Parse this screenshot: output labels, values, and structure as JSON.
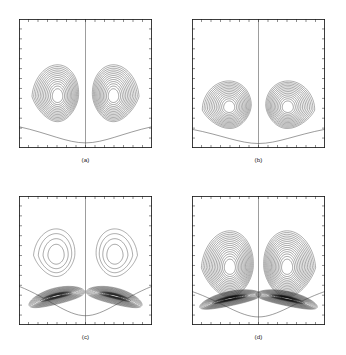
{
  "figure": {
    "type": "contour-plot-grid",
    "rows": 2,
    "cols": 2,
    "background_color": "#ffffff",
    "line_color": "#3a3a3a",
    "frame_color": "#1a1a1a"
  },
  "panels": [
    {
      "id": "a",
      "caption": "(a)",
      "position": {
        "x": 19,
        "y": 19,
        "width": 133,
        "height": 129
      },
      "description": "Symmetric counter-rotating vortex pair, centers at mid-height",
      "ticks": {
        "top": 14,
        "bottom": 14,
        "left": 13,
        "right": 13
      },
      "centerline": true,
      "vortex": {
        "cx_left": 0.29,
        "cx_right": 0.71,
        "cy": 0.6,
        "rings": 13,
        "rx": 0.175,
        "ry": 0.245,
        "tilt": 0,
        "dark_band": false
      },
      "separatrix": {
        "depth": 0.165,
        "present": true
      }
    },
    {
      "id": "b",
      "caption": "(b)",
      "position": {
        "x": 192,
        "y": 19,
        "width": 133,
        "height": 129
      },
      "description": "Vortex pair shifted downward, flattened cores, tighter spacing",
      "ticks": {
        "top": 14,
        "bottom": 14,
        "left": 13,
        "right": 13
      },
      "centerline": true,
      "vortex": {
        "cx_left": 0.28,
        "cx_right": 0.72,
        "cy": 0.685,
        "rings": 13,
        "rx": 0.185,
        "ry": 0.205,
        "tilt": 6,
        "dark_band": false
      },
      "separatrix": {
        "depth": 0.145,
        "present": true
      }
    },
    {
      "id": "c",
      "caption": "(c)",
      "position": {
        "x": 19,
        "y": 196,
        "width": 133,
        "height": 129
      },
      "description": "Sparse upper vortices with dense dark crescent boundary layer near base",
      "ticks": {
        "top": 14,
        "bottom": 14,
        "left": 13,
        "right": 13
      },
      "centerline": true,
      "vortex": {
        "cx_left": 0.28,
        "cx_right": 0.72,
        "cy": 0.46,
        "rings": 4,
        "rx": 0.155,
        "ry": 0.205,
        "tilt": 0,
        "dark_band": true
      },
      "band": {
        "cy": 0.775,
        "rings": 17,
        "rx": 0.215,
        "ry": 0.062,
        "tilt": 14
      },
      "separatrix": {
        "depth": 0.3,
        "present": true
      }
    },
    {
      "id": "d",
      "caption": "(d)",
      "position": {
        "x": 192,
        "y": 196,
        "width": 133,
        "height": 129
      },
      "description": "Many nested contours with strong dark boundary-layer band at base",
      "ticks": {
        "top": 14,
        "bottom": 14,
        "left": 13,
        "right": 13
      },
      "centerline": true,
      "vortex": {
        "cx_left": 0.285,
        "cx_right": 0.715,
        "cy": 0.555,
        "rings": 15,
        "rx": 0.195,
        "ry": 0.285,
        "tilt": 0,
        "dark_band": true
      },
      "band": {
        "cy": 0.795,
        "rings": 19,
        "rx": 0.235,
        "ry": 0.055,
        "tilt": 12
      },
      "separatrix": {
        "depth": 0.26,
        "present": true
      }
    }
  ],
  "chart_data": {
    "type": "line",
    "title": "",
    "xlabel": "",
    "ylabel": "",
    "subplot_labels": [
      "(a)",
      "(b)",
      "(c)",
      "(d)"
    ],
    "plot_kind": "streamline contour map",
    "xlim": [
      0,
      1
    ],
    "ylim": [
      0,
      1
    ],
    "grid": false,
    "legend": "none",
    "axis_tick_labels": [],
    "series": [
      {
        "name": "(a)",
        "contour_levels": 13,
        "vortex_center_y": 0.6,
        "band_levels": 0
      },
      {
        "name": "(b)",
        "contour_levels": 13,
        "vortex_center_y": 0.685,
        "band_levels": 0
      },
      {
        "name": "(c)",
        "contour_levels": 4,
        "vortex_center_y": 0.46,
        "band_levels": 17
      },
      {
        "name": "(d)",
        "contour_levels": 15,
        "vortex_center_y": 0.555,
        "band_levels": 19
      }
    ]
  }
}
